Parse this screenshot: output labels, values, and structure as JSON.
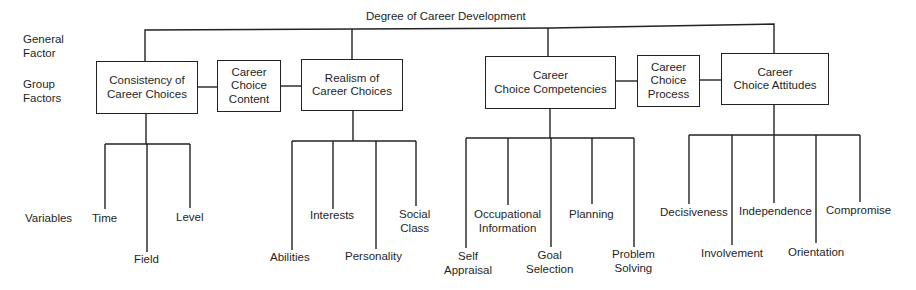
{
  "diagram": {
    "title": "Degree of Career Development",
    "level_labels": {
      "general": "General\nFactor",
      "group": "Group\nFactors",
      "variables": "Variables"
    },
    "group_factors": [
      {
        "label": "Consistency of\nCareer Choices",
        "category": "Career Choice Content",
        "variables": [
          "Time",
          "Field",
          "Level"
        ]
      },
      {
        "label": "Career\nChoice\nContent",
        "is_category": true
      },
      {
        "label": "Realism of\nCareer Choices",
        "category": "Career Choice Content",
        "variables": [
          "Abilities",
          "Interests",
          "Personality",
          "Social\nClass"
        ]
      },
      {
        "label": "Career\nChoice Competencies",
        "category": "Career Choice Process",
        "variables": [
          "Self\nAppraisal",
          "Occupational\nInformation",
          "Goal\nSelection",
          "Planning",
          "Problem\nSolving"
        ]
      },
      {
        "label": "Career\nChoice\nProcess",
        "is_category": true
      },
      {
        "label": "Career\nChoice Attitudes",
        "category": "Career Choice Process",
        "variables": [
          "Decisiveness",
          "Involvement",
          "Independence",
          "Orientation",
          "Compromise"
        ]
      }
    ]
  },
  "text": {
    "title": "Degree of Career Development",
    "general_factor": "General\nFactor",
    "group_factors": "Group\nFactors",
    "variables_label": "Variables",
    "box_consistency": "Consistency of\nCareer Choices",
    "box_content": "Career\nChoice\nContent",
    "box_realism": "Realism of\nCareer Choices",
    "box_competencies": "Career\nChoice Competencies",
    "box_process": "Career\nChoice\nProcess",
    "box_attitudes": "Career\nChoice Attitudes",
    "v_time": "Time",
    "v_field": "Field",
    "v_level": "Level",
    "v_abilities": "Abilities",
    "v_interests": "Interests",
    "v_personality": "Personality",
    "v_social_class": "Social\nClass",
    "v_self_appraisal": "Self\nAppraisal",
    "v_occupational_information": "Occupational\nInformation",
    "v_goal_selection": "Goal\nSelection",
    "v_planning": "Planning",
    "v_problem_solving": "Problem\nSolving",
    "v_decisiveness": "Decisiveness",
    "v_involvement": "Involvement",
    "v_independence": "Independence",
    "v_orientation": "Orientation",
    "v_compromise": "Compromise"
  }
}
